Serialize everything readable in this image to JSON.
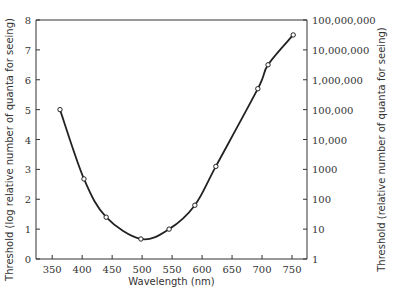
{
  "chart_data": {
    "type": "line",
    "title": "",
    "xlabel": "Wavelength (nm)",
    "ylabel": "Threshold (log relative number of quanta for seeing)",
    "ylabel_right": "Threshold (relative number of quanta for seeing)",
    "xlim": [
      323,
      775
    ],
    "ylim": [
      0,
      8
    ],
    "x_ticks": [
      350,
      400,
      450,
      500,
      550,
      600,
      650,
      700,
      750
    ],
    "x_tick_labels": [
      "350",
      "400",
      "450",
      "500",
      "550",
      "600",
      "650",
      "700",
      "750"
    ],
    "y_ticks": [
      0,
      1,
      2,
      3,
      4,
      5,
      6,
      7,
      8
    ],
    "y_tick_labels": [
      "0",
      "1",
      "2",
      "3",
      "4",
      "5",
      "6",
      "7",
      "8"
    ],
    "y_right_ticks": [
      0,
      1,
      2,
      3,
      4,
      5,
      6,
      7,
      8
    ],
    "y_right_tick_labels": [
      "1",
      "10",
      "100",
      "1000",
      "10,000",
      "100,000",
      "1,000,000",
      "10,000,000",
      "100,000,000"
    ],
    "grid": false,
    "series": [
      {
        "name": "Threshold",
        "x": [
          363,
          403,
          440,
          498,
          545,
          588,
          623,
          693,
          710,
          752
        ],
        "values": [
          5.0,
          2.68,
          1.4,
          0.67,
          1.0,
          1.8,
          3.1,
          5.7,
          6.5,
          7.5
        ]
      }
    ]
  }
}
